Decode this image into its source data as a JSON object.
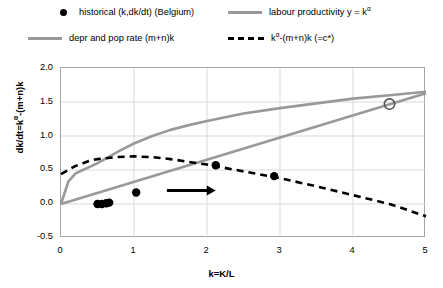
{
  "legend": {
    "items": [
      {
        "name": "historical-points",
        "marker": "dot",
        "label_pre": "historical (k,dk/dt) (Belgium)",
        "sup": "",
        "label_post": ""
      },
      {
        "name": "labour-productivity",
        "marker": "line",
        "label_pre": "labour productivity y = k",
        "sup": "α",
        "label_post": ""
      },
      {
        "name": "depr-pop-rate",
        "marker": "line",
        "label_pre": "depr and pop rate (m+n)k",
        "sup": "",
        "label_post": ""
      },
      {
        "name": "net-investment",
        "marker": "dash",
        "label_pre": "k",
        "sup": "α",
        "label_post": "-(m+n)k (=c*)"
      }
    ]
  },
  "axes": {
    "ylabel_pre": "dk/dt=k",
    "ylabel_sup": "α",
    "ylabel_post": "-(m+n)k",
    "xlabel": "k=K/L",
    "yticks": [
      "2.0",
      "1.5",
      "1.0",
      "0.5",
      "0.0",
      "-0.5"
    ],
    "xticks": [
      "0",
      "1",
      "2",
      "3",
      "4",
      "5"
    ]
  },
  "colors": {
    "curve_grey": "#999999",
    "dashed_black": "#000000",
    "point_black": "#000000",
    "gridline": "#d9d9d9",
    "axis": "#a6a6a6"
  },
  "chart_data": {
    "type": "line",
    "title": "",
    "xlabel": "k=K/L",
    "ylabel": "dk/dt=k^α-(m+n)k",
    "xlim": [
      0,
      5
    ],
    "ylim": [
      -0.5,
      2.0
    ],
    "grid": true,
    "legend_position": "top",
    "series": [
      {
        "name": "labour productivity y = k^α",
        "type": "line",
        "color": "#999999",
        "style": "solid",
        "x": [
          0,
          0.1,
          0.2,
          0.3,
          0.4,
          0.5,
          0.6,
          0.8,
          1.0,
          1.25,
          1.5,
          1.75,
          2.0,
          2.5,
          3.0,
          3.5,
          4.0,
          4.5,
          5.0
        ],
        "y": [
          0.0,
          0.33,
          0.45,
          0.5,
          0.55,
          0.6,
          0.66,
          0.78,
          0.89,
          1.0,
          1.09,
          1.16,
          1.22,
          1.33,
          1.41,
          1.48,
          1.55,
          1.6,
          1.65
        ]
      },
      {
        "name": "depr and pop rate (m+n)k",
        "type": "line",
        "color": "#999999",
        "style": "solid",
        "x": [
          0,
          5
        ],
        "y": [
          0.0,
          1.63
        ]
      },
      {
        "name": "k^α-(m+n)k (=c*)",
        "type": "line",
        "color": "#000000",
        "style": "dashed",
        "x": [
          0,
          0.1,
          0.2,
          0.3,
          0.4,
          0.5,
          0.75,
          1.0,
          1.25,
          1.5,
          1.75,
          2.0,
          2.5,
          3.0,
          3.5,
          4.0,
          4.5,
          5.0
        ],
        "y": [
          0.44,
          0.5,
          0.56,
          0.6,
          0.64,
          0.66,
          0.69,
          0.7,
          0.69,
          0.66,
          0.62,
          0.58,
          0.48,
          0.38,
          0.26,
          0.13,
          0.0,
          -0.18
        ]
      },
      {
        "name": "historical (k,dk/dt) (Belgium)",
        "type": "scatter",
        "color": "#000000",
        "points": [
          {
            "x": 0.5,
            "y": 0.0
          },
          {
            "x": 0.56,
            "y": 0.0
          },
          {
            "x": 0.62,
            "y": 0.01
          },
          {
            "x": 0.66,
            "y": 0.02
          },
          {
            "x": 1.03,
            "y": 0.17
          },
          {
            "x": 2.12,
            "y": 0.57
          },
          {
            "x": 2.92,
            "y": 0.41
          }
        ]
      },
      {
        "name": "steady-state intersection",
        "type": "scatter-open",
        "color": "#555555",
        "points": [
          {
            "x": 4.5,
            "y": 1.47
          }
        ]
      }
    ],
    "annotations": [
      {
        "name": "direction-arrow",
        "type": "arrow",
        "x_start": 1.45,
        "x_end": 2.12,
        "y": 0.2,
        "color": "#000000"
      }
    ]
  }
}
